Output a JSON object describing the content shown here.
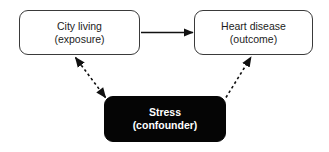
{
  "diagram": {
    "type": "confounding-dag",
    "background_color": "#ffffff",
    "nodes": [
      {
        "id": "exposure",
        "label_line_1": "City living",
        "label_line_2": "(exposure)",
        "role": "exposure",
        "style": "outlined",
        "fill_color": "#ffffff",
        "border_color": "#3a3a3a",
        "text_color": "#1c1c1c",
        "bold": false
      },
      {
        "id": "outcome",
        "label_line_1": "Heart disease",
        "label_line_2": "(outcome)",
        "role": "outcome",
        "style": "outlined",
        "fill_color": "#ffffff",
        "border_color": "#3a3a3a",
        "text_color": "#1c1c1c",
        "bold": false
      },
      {
        "id": "confounder",
        "label_line_1": "Stress",
        "label_line_2": "(confounder)",
        "role": "confounder",
        "style": "filled",
        "fill_color": "#050505",
        "border_color": "#050505",
        "text_color": "#ffffff",
        "bold": true
      }
    ],
    "edges": [
      {
        "id": "exposure-to-outcome",
        "from": "exposure",
        "to": "outcome",
        "stroke": "solid",
        "color": "#111111",
        "arrowheads": "end",
        "label": ""
      },
      {
        "id": "confounder-exposure",
        "from": "confounder",
        "to": "exposure",
        "stroke": "dashed",
        "color": "#111111",
        "arrowheads": "both",
        "label": ""
      },
      {
        "id": "confounder-to-outcome",
        "from": "confounder",
        "to": "outcome",
        "stroke": "dashed",
        "color": "#111111",
        "arrowheads": "end",
        "label": ""
      }
    ]
  }
}
